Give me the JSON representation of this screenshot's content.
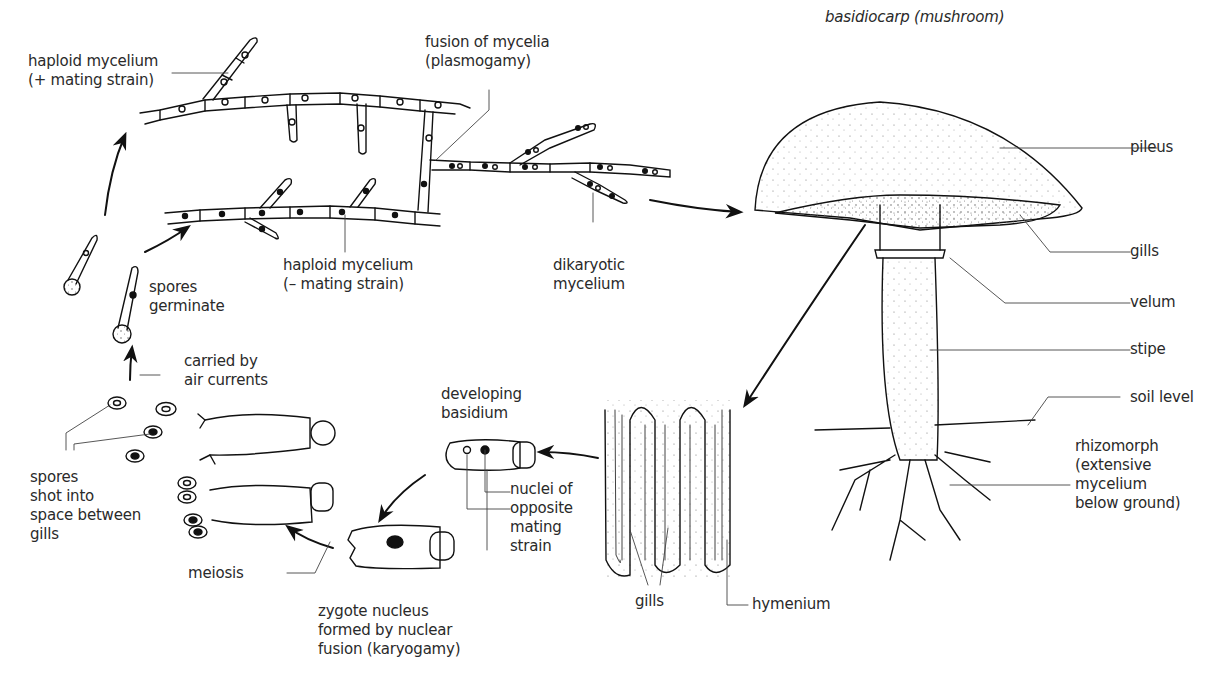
{
  "diagram": {
    "title": "basidiocarp (mushroom)",
    "labels": {
      "haploid_plus": "haploid mycelium\n(+ mating strain)",
      "fusion": "fusion of mycelia\n(plasmogamy)",
      "haploid_minus": "haploid mycelium\n(– mating strain)",
      "dikaryotic": "dikaryotic\nmycelium",
      "spores_germinate": "spores\ngerminate",
      "carried_by_air": "carried by\nair currents",
      "spores_shot": "spores\nshot into\nspace between\ngills",
      "meiosis": "meiosis",
      "zygote": "zygote nucleus\nformed by nuclear\nfusion (karyogamy)",
      "developing_basidium": "developing\nbasidium",
      "nuclei": "nuclei of\nopposite\nmating\nstrain",
      "gills_section": "gills",
      "hymenium": "hymenium",
      "pileus": "pileus",
      "gills": "gills",
      "velum": "velum",
      "stipe": "stipe",
      "soil_level": "soil level",
      "rhizomorph": "rhizomorph\n(extensive\nmycelium\nbelow ground)"
    }
  }
}
